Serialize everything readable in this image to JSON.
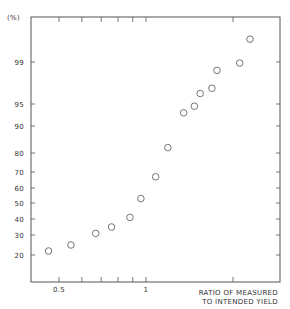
{
  "chart_data": {
    "type": "scatter",
    "title": "",
    "xlabel": "RATIO OF MEASURED TO INTENDED YIELD",
    "xlabel_lines": [
      "RATIO OF MEASURED",
      "TO INTENDED YIELD"
    ],
    "ylabel": "(%)",
    "x_scale": "log",
    "y_scale": "probability",
    "xlim": [
      0.41,
      2.6
    ],
    "ylim": [
      10,
      99.7
    ],
    "x_ticks": [
      {
        "value": 0.5,
        "label": "0.5"
      },
      {
        "value": 0.6,
        "label": ""
      },
      {
        "value": 0.7,
        "label": ""
      },
      {
        "value": 0.8,
        "label": ""
      },
      {
        "value": 0.9,
        "label": ""
      },
      {
        "value": 1,
        "label": "1"
      },
      {
        "value": 2,
        "label": ""
      }
    ],
    "y_ticks": [
      {
        "value": 99,
        "label": "99"
      },
      {
        "value": 95,
        "label": "95"
      },
      {
        "value": 90,
        "label": "90"
      },
      {
        "value": 80,
        "label": "80"
      },
      {
        "value": 70,
        "label": "70"
      },
      {
        "value": 60,
        "label": "60"
      },
      {
        "value": 50,
        "label": "50"
      },
      {
        "value": 40,
        "label": "40"
      },
      {
        "value": 30,
        "label": "30"
      },
      {
        "value": 20,
        "label": "20"
      }
    ],
    "grid": false,
    "legend": null,
    "marker": "open-circle",
    "series": [
      {
        "name": "cumulative frequency",
        "x": [
          0.46,
          0.55,
          0.67,
          0.76,
          0.88,
          0.96,
          1.08,
          1.19,
          1.35,
          1.47,
          1.54,
          1.69,
          1.76,
          2.11,
          2.29
        ],
        "y": [
          22,
          25,
          31,
          35,
          41,
          53,
          67,
          82,
          93,
          94.5,
          96,
          96.5,
          98.2,
          98.9,
          99.5
        ]
      }
    ]
  }
}
